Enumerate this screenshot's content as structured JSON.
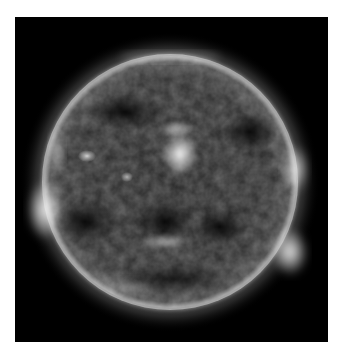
{
  "image": {
    "subject": "Sun in extreme ultraviolet (grayscale)",
    "background_color": "#000000",
    "page_color": "#ffffff",
    "disc": {
      "cx": 155,
      "cy": 165,
      "r": 128
    },
    "features": [
      {
        "name": "central-active-region",
        "cx": 165,
        "cy": 137
      },
      {
        "name": "west-limb-bright-region-upper",
        "cx": 280,
        "cy": 152
      },
      {
        "name": "west-limb-bright-region-lower",
        "cx": 275,
        "cy": 235
      },
      {
        "name": "east-limb-bright-region",
        "cx": 30,
        "cy": 193
      },
      {
        "name": "east-active-region-small",
        "cx": 72,
        "cy": 139
      }
    ]
  }
}
